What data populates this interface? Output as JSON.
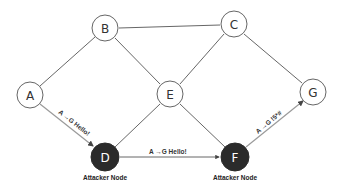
{
  "diagram": {
    "type": "network-graph",
    "colors": {
      "edge": "#555555",
      "attack_edge": "#9a9a9a",
      "normal_node_fill": "#ffffff",
      "normal_node_stroke": "#666666",
      "attacker_node_fill": "#2b2b2b"
    },
    "nodes": [
      {
        "id": "A",
        "label": "A",
        "kind": "normal"
      },
      {
        "id": "B",
        "label": "B",
        "kind": "normal"
      },
      {
        "id": "C",
        "label": "C",
        "kind": "normal"
      },
      {
        "id": "D",
        "label": "D",
        "kind": "attacker",
        "caption": "Attacker Node"
      },
      {
        "id": "E",
        "label": "E",
        "kind": "normal"
      },
      {
        "id": "F",
        "label": "F",
        "kind": "attacker",
        "caption": "Attacker Node"
      },
      {
        "id": "G",
        "label": "G",
        "kind": "normal"
      }
    ],
    "edges": [
      {
        "from": "A",
        "to": "B"
      },
      {
        "from": "B",
        "to": "C"
      },
      {
        "from": "B",
        "to": "E"
      },
      {
        "from": "C",
        "to": "E"
      },
      {
        "from": "C",
        "to": "G"
      },
      {
        "from": "E",
        "to": "D"
      },
      {
        "from": "E",
        "to": "F"
      },
      {
        "from": "A",
        "to": "D",
        "message": "A →G Hello!",
        "directed": true
      },
      {
        "from": "D",
        "to": "F",
        "message": "A →G Hello!",
        "directed": true
      },
      {
        "from": "F",
        "to": "G",
        "message": "A →G !5*#",
        "directed": true
      }
    ]
  }
}
